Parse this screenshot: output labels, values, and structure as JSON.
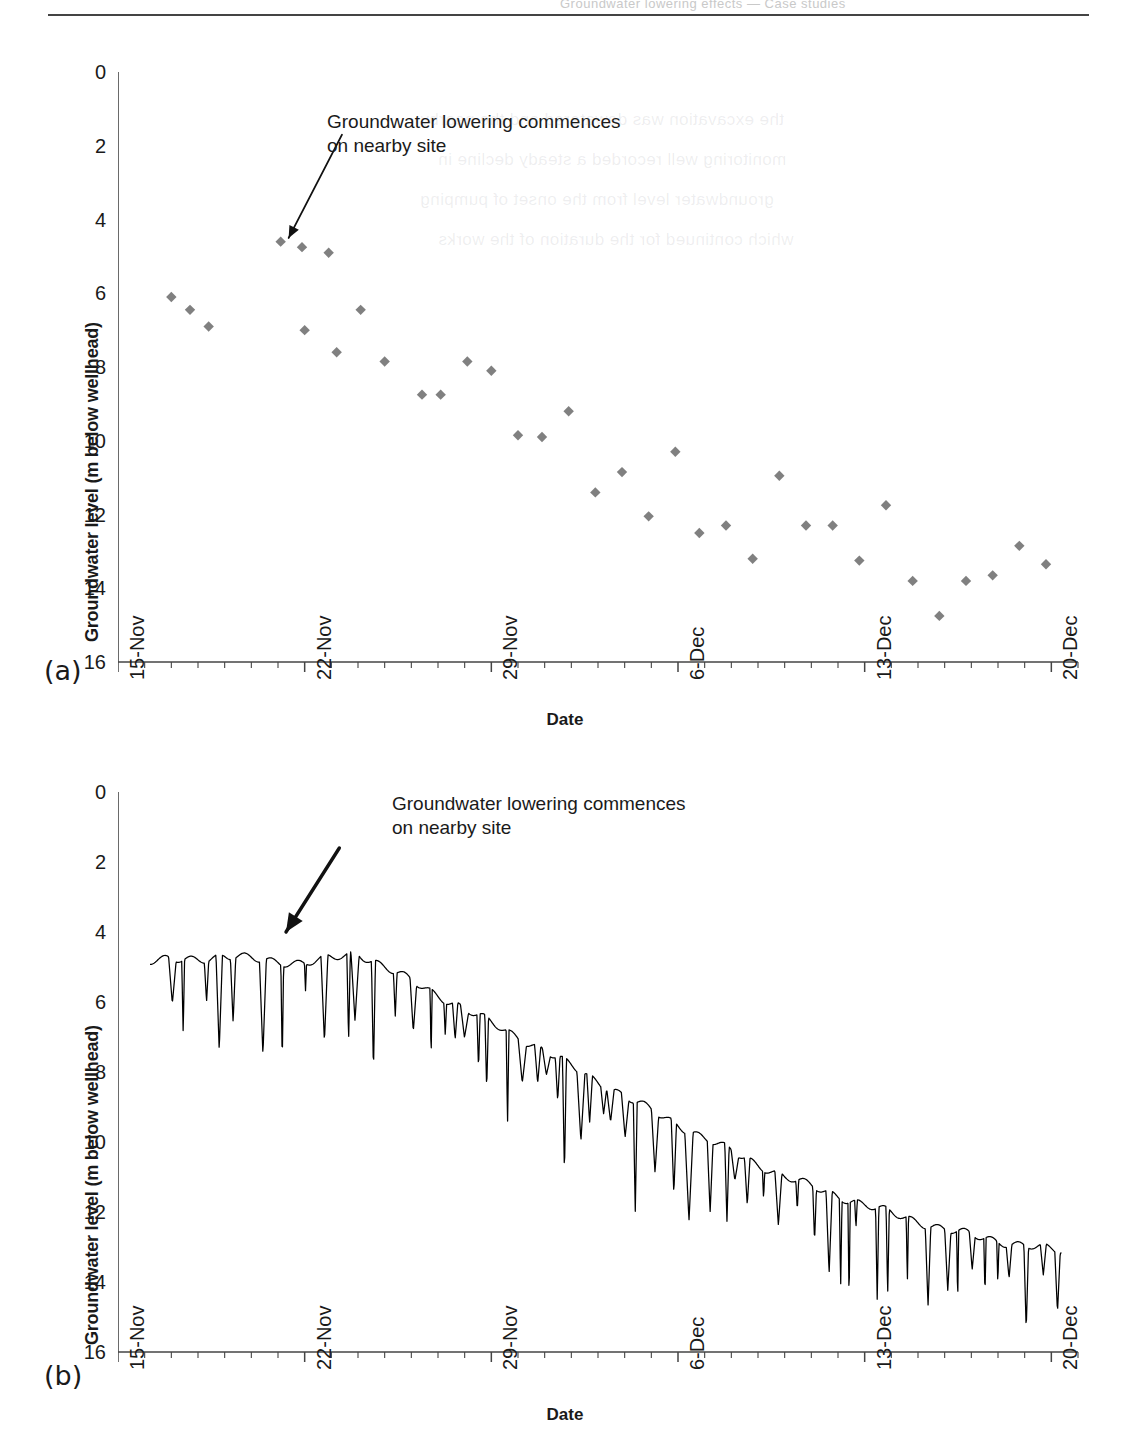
{
  "page": {
    "header_text": "Groundwater lowering effects — Case studies",
    "ghost_lines": [
      "the excavation was dewatered and the nearby",
      "monitoring well recorded a steady decline in",
      "groundwater level from the onset of pumping",
      "which continued for the duration of the works"
    ]
  },
  "figure": {
    "panel_a_tag": "(a)",
    "panel_b_tag": "(b)"
  },
  "chart_data": [
    {
      "id": "chart-a",
      "type": "scatter",
      "title": "",
      "xlabel": "Date",
      "ylabel": "Groundwater level (m below wellhead)",
      "ylim": [
        0,
        16
      ],
      "yticks": [
        0,
        2,
        4,
        6,
        8,
        10,
        12,
        14,
        16
      ],
      "ytick_labels": [
        "0",
        "2",
        "4",
        "6",
        "8",
        "10",
        "12",
        "14",
        "16"
      ],
      "y_inverted": true,
      "xlim": [
        "15-Nov",
        "21-Dec"
      ],
      "xtick_labels": [
        "15-Nov",
        "22-Nov",
        "29-Nov",
        "6-Dec",
        "13-Dec",
        "20-Dec"
      ],
      "xtick_days": [
        0,
        7,
        14,
        21,
        28,
        35
      ],
      "x_minor_tick_interval_days": 1,
      "x_total_days": 36,
      "grid": false,
      "legend": "none",
      "marker": "diamond",
      "marker_color": "#808080",
      "annotations": [
        {
          "text": "Groundwater lowering commences\non nearby site",
          "arrow_from_day": 8.4,
          "arrow_from_value": 1.7,
          "arrow_to_day": 6.4,
          "arrow_to_value": 4.5
        }
      ],
      "x": [
        2.0,
        2.7,
        3.4,
        6.1,
        6.9,
        7.0,
        7.9,
        8.2,
        9.1,
        10.0,
        11.4,
        12.1,
        13.1,
        14.0,
        15.0,
        15.9,
        16.9,
        17.9,
        18.9,
        19.9,
        20.9,
        21.8,
        22.8,
        23.8,
        24.8,
        25.8,
        26.8,
        27.8,
        28.8,
        29.8,
        30.8,
        31.8,
        32.8,
        33.8,
        34.8
      ],
      "y": [
        6.1,
        6.45,
        6.9,
        4.6,
        4.75,
        7.0,
        4.9,
        7.6,
        6.45,
        7.85,
        8.75,
        8.75,
        7.85,
        8.1,
        9.85,
        9.9,
        9.2,
        11.4,
        10.85,
        12.05,
        10.3,
        12.5,
        12.3,
        13.2,
        10.95,
        12.3,
        12.3,
        13.25,
        11.75,
        13.8,
        14.75,
        13.8,
        13.65,
        12.85,
        13.35
      ]
    },
    {
      "id": "chart-b",
      "type": "line",
      "title": "",
      "xlabel": "Date",
      "ylabel": "Groundwater level (m below wellhead)",
      "ylim": [
        0,
        16
      ],
      "yticks": [
        0,
        2,
        4,
        6,
        8,
        10,
        12,
        14,
        16
      ],
      "ytick_labels": [
        "0",
        "2",
        "4",
        "6",
        "8",
        "10",
        "12",
        "14",
        "16"
      ],
      "y_inverted": true,
      "xlim": [
        "15-Nov",
        "21-Dec"
      ],
      "xtick_labels": [
        "15-Nov",
        "22-Nov",
        "29-Nov",
        "6-Dec",
        "13-Dec",
        "20-Dec"
      ],
      "xtick_days": [
        0,
        7,
        14,
        21,
        28,
        35
      ],
      "x_minor_tick_interval_days": 1,
      "x_total_days": 36,
      "grid": false,
      "legend": "none",
      "line_color": "#000000",
      "description": "High-frequency datalogger record: a slowly declining baseline with frequent sharp downward drawdown spikes",
      "baseline_x": [
        1.2,
        4.0,
        7.0,
        9.0,
        11.0,
        13.0,
        16.0,
        19.0,
        22.0,
        25.0,
        28.0,
        31.0,
        33.5,
        35.2
      ],
      "baseline_y": [
        4.85,
        4.7,
        4.9,
        4.6,
        5.4,
        6.2,
        7.4,
        8.7,
        9.9,
        11.0,
        11.8,
        12.5,
        12.9,
        13.1
      ],
      "spike_depth_range": [
        0.6,
        3.0
      ],
      "annotations": [
        {
          "text": "Groundwater lowering commences\non nearby site",
          "arrow_from_day": 8.3,
          "arrow_from_value": 1.6,
          "arrow_to_day": 6.3,
          "arrow_to_value": 4.0
        }
      ]
    }
  ]
}
